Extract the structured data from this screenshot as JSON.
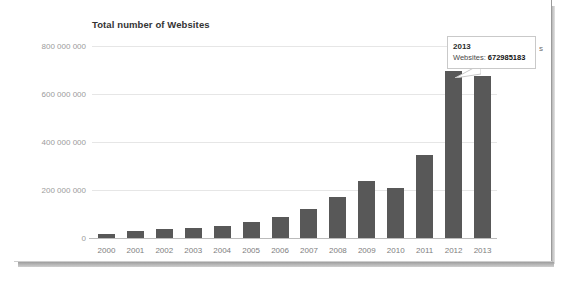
{
  "chart": {
    "title": "Total number of Websites",
    "legend_clipped_text": "s"
  },
  "tooltip": {
    "title": "2013",
    "series_label": "Websites:",
    "value": "672985183"
  },
  "chart_data": {
    "type": "bar",
    "title": "Total number of Websites",
    "xlabel": "",
    "ylabel": "",
    "categories": [
      "2000",
      "2001",
      "2002",
      "2003",
      "2004",
      "2005",
      "2006",
      "2007",
      "2008",
      "2009",
      "2010",
      "2011",
      "2012",
      "2013"
    ],
    "values": [
      17087182,
      29254370,
      38760373,
      40912332,
      51611646,
      64780617,
      85507314,
      121892559,
      172338726,
      238027855,
      206956723,
      346004403,
      697089489,
      672985183
    ],
    "ytick_labels": [
      "0",
      "200 000 000",
      "400 000 000",
      "600 000 000",
      "800 000 000"
    ],
    "ytick_values": [
      0,
      200000000,
      400000000,
      600000000,
      800000000
    ],
    "ylim": [
      0,
      800000000
    ],
    "grid": true,
    "legend_position": "none",
    "bar_color": "#585858",
    "gridline_color": "#e6e6e6",
    "axis_color": "#bbbbbb",
    "annotations": [
      {
        "type": "tooltip",
        "attached_to_category": "2013",
        "title": "2013",
        "label": "Websites:",
        "value": "672985183"
      }
    ]
  }
}
